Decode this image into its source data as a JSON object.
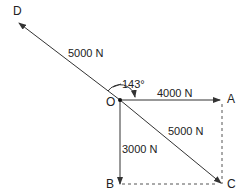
{
  "diagram": {
    "type": "force-vector-diagram",
    "points": {
      "O": {
        "label": "O",
        "x": 120,
        "y": 100
      },
      "A": {
        "label": "A",
        "x": 222,
        "y": 100
      },
      "B": {
        "label": "B",
        "x": 120,
        "y": 184
      },
      "C": {
        "label": "C",
        "x": 222,
        "y": 184
      },
      "D": {
        "label": "D",
        "x": 18,
        "y": 22
      }
    },
    "vectors": [
      {
        "from": "O",
        "to": "A",
        "label": "4000 N",
        "style": "solid-arrow"
      },
      {
        "from": "O",
        "to": "B",
        "label": "3000 N",
        "style": "solid-arrow"
      },
      {
        "from": "O",
        "to": "C",
        "label": "5000 N",
        "style": "solid-arrow"
      },
      {
        "from": "O",
        "to": "D",
        "label": "5000 N",
        "style": "solid-arrow"
      }
    ],
    "construction_lines": [
      {
        "from": "A",
        "to": "C",
        "style": "dashed"
      },
      {
        "from": "B",
        "to": "C",
        "style": "dashed"
      }
    ],
    "angle": {
      "label": "143°",
      "between": [
        "OA",
        "OD"
      ]
    },
    "labels": {
      "force_OD": "5000 N",
      "force_OA": "4000 N",
      "force_OC": "5000 N",
      "force_OB": "3000 N",
      "angle": "143°",
      "point_O": "O",
      "point_A": "A",
      "point_B": "B",
      "point_C": "C",
      "point_D": "D"
    },
    "colors": {
      "line": "#333333",
      "dashed": "#555555",
      "text": "#222222"
    }
  }
}
